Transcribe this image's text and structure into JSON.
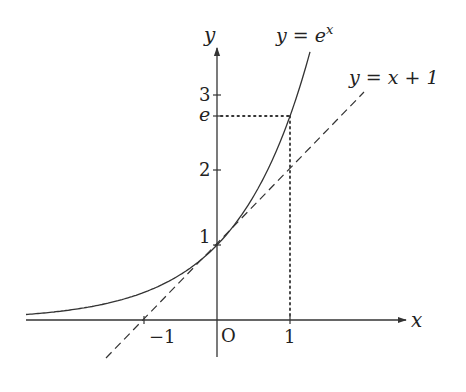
{
  "diagram": {
    "axes": {
      "x_label": "x",
      "y_label": "y",
      "origin_label": "O"
    },
    "x_ticks": [
      {
        "value": -1,
        "label": "−1"
      },
      {
        "value": 1,
        "label": "1"
      }
    ],
    "y_ticks": [
      {
        "value": 1,
        "label": "1"
      },
      {
        "value": 2,
        "label": "2"
      },
      {
        "value": 2.718,
        "label": "e"
      },
      {
        "value": 3,
        "label": "3"
      }
    ],
    "curves": [
      {
        "name": "exponential",
        "label_lhs": "y = e",
        "label_sup": "x",
        "style": "solid"
      },
      {
        "name": "tangent-line",
        "label": "y = x + 1",
        "style": "dashed"
      }
    ],
    "guides": {
      "style": "dotted",
      "description": "Dotted lines from (1, e) to the axes"
    },
    "colors": {
      "stroke": "#333333",
      "text": "#222222",
      "background": "#ffffff"
    }
  }
}
